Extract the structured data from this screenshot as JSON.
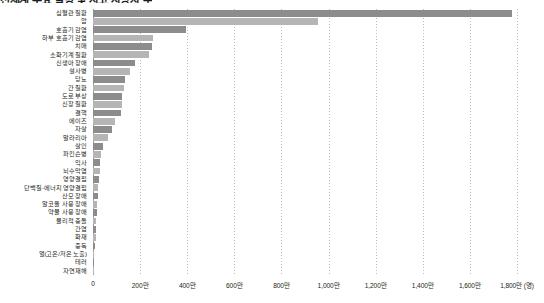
{
  "chart_data": {
    "type": "bar",
    "orientation": "horizontal",
    "title": "전세계 주요 질병 및 사고 사망자 수",
    "xlabel": "(명)",
    "ylabel": "",
    "xlim": [
      0,
      18000000
    ],
    "grid": true,
    "legend": false,
    "unit_suffix": "만",
    "tick_labels": [
      "0",
      "200만",
      "400만",
      "600만",
      "800만",
      "1,000만",
      "1,200만",
      "1,400만",
      "1,600만",
      "1,800만 (명)"
    ],
    "tick_values": [
      0,
      2000000,
      4000000,
      6000000,
      8000000,
      10000000,
      12000000,
      14000000,
      16000000,
      18000000
    ],
    "categories": [
      "심혈관 질환",
      "암",
      "호흡기 감염",
      "하부 호흡기 감염",
      "치매",
      "소화기계 질환",
      "신생아 장애",
      "설사병",
      "당뇨",
      "간 질환",
      "도로 부상",
      "신장 질환",
      "결핵",
      "에이즈",
      "자살",
      "말라리아",
      "살인",
      "파킨슨병",
      "익사",
      "뇌수막염",
      "영양결핍",
      "단백질-에너지 영양결핍",
      "산모 장애",
      "알코올 사용 장애",
      "약물 사용 장애",
      "물리적 충돌",
      "간염",
      "화재",
      "중독",
      "열(고온/저온 노출)",
      "테러",
      "자연재해"
    ],
    "values": [
      17790000,
      9560000,
      3960000,
      2560000,
      2510000,
      2380000,
      1780000,
      1570000,
      1370000,
      1320000,
      1240000,
      1230000,
      1180000,
      954000,
      793000,
      620000,
      405000,
      340000,
      295000,
      288000,
      269000,
      231000,
      193000,
      184000,
      166000,
      129000,
      126000,
      120000,
      72000,
      53000,
      26000,
      9600
    ],
    "bar_colors": [
      "#8c8c8c",
      "#b5b5b5",
      "#8c8c8c",
      "#b5b5b5",
      "#8c8c8c",
      "#b5b5b5",
      "#8c8c8c",
      "#b5b5b5",
      "#8c8c8c",
      "#b5b5b5",
      "#8c8c8c",
      "#b5b5b5",
      "#8c8c8c",
      "#b5b5b5",
      "#8c8c8c",
      "#b5b5b5",
      "#8c8c8c",
      "#b5b5b5",
      "#8c8c8c",
      "#b5b5b5",
      "#8c8c8c",
      "#b5b5b5",
      "#8c8c8c",
      "#b5b5b5",
      "#8c8c8c",
      "#b5b5b5",
      "#8c8c8c",
      "#b5b5b5",
      "#8c8c8c",
      "#b5b5b5",
      "#8c8c8c",
      "#b5b5b5"
    ],
    "colors": {
      "bar_dark": "#8c8c8c",
      "bar_light": "#b5b5b5",
      "gridline": "#b9b9b9",
      "axis": "#9a9a9a",
      "text": "#231f20",
      "background": "#ffffff"
    }
  }
}
